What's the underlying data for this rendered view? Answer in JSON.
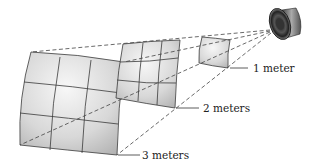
{
  "diagram": {
    "source": {
      "icon": "speaker-icon"
    },
    "surfaces": [
      {
        "id": "surface-1m",
        "distance_label": "1 meter",
        "grid": "3x3"
      },
      {
        "id": "surface-2m",
        "distance_label": "2 meters",
        "grid": "3x3"
      },
      {
        "id": "surface-3m",
        "distance_label": "3 meters",
        "grid": "3x3"
      }
    ],
    "colors": {
      "surface_fill_light": "#f2f2f2",
      "surface_fill_dark": "#b5b5b5",
      "grid_line": "#3a3a3a",
      "ray_dash": "#444444",
      "label_text": "#222222"
    }
  }
}
